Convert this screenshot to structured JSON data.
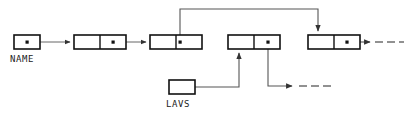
{
  "diagram": {
    "type": "linked-list-pointer-diagram",
    "background_color": "#ffffff",
    "stroke_color": "#1a1a1a",
    "line_color": "#555555",
    "labels": {
      "name": "NAME",
      "lavs": "LAVS"
    },
    "nodes": [
      {
        "id": "name-head",
        "name": "name-head-cell",
        "cells": 1,
        "dots": [
          0
        ],
        "x": 14,
        "y": 35,
        "width": 26,
        "height": 14,
        "label": "NAME"
      },
      {
        "id": "node-1",
        "name": "list-node-1",
        "cells": 2,
        "dots": [
          1
        ],
        "x": 74,
        "y": 35,
        "width": 52,
        "height": 14
      },
      {
        "id": "node-2",
        "name": "list-node-2",
        "cells": 2,
        "dots": [
          1
        ],
        "x": 150,
        "y": 35,
        "width": 52,
        "height": 14
      },
      {
        "id": "node-3",
        "name": "list-node-3",
        "cells": 2,
        "dots": [
          1
        ],
        "x": 228,
        "y": 35,
        "width": 52,
        "height": 14
      },
      {
        "id": "node-4",
        "name": "list-node-4",
        "cells": 2,
        "dots": [
          1
        ],
        "x": 308,
        "y": 35,
        "width": 52,
        "height": 14
      },
      {
        "id": "lavs-head",
        "name": "lavs-head-cell",
        "cells": 1,
        "dots": [],
        "x": 169,
        "y": 80,
        "width": 26,
        "height": 14,
        "label": "LAVS"
      }
    ],
    "connections": [
      {
        "name": "edge-name-to-node1",
        "from": "name-head",
        "to": "node-1",
        "style": "solid",
        "arrow": "right"
      },
      {
        "name": "edge-node1-to-node2",
        "from": "node-1",
        "to": "node-2",
        "style": "solid",
        "arrow": "right"
      },
      {
        "name": "edge-node2-up-over-to-node4",
        "from": "node-2",
        "to": "node-4",
        "style": "solid",
        "arrow": "down",
        "routing": "up-over-down"
      },
      {
        "name": "edge-lavs-up-to-node3",
        "from": "lavs-head",
        "to": "node-3",
        "style": "solid",
        "arrow": "up",
        "routing": "right-up"
      },
      {
        "name": "edge-node3-down-right-dashed",
        "from": "node-3",
        "to": "continuation",
        "style": "solid-then-dashed",
        "arrow": "right",
        "routing": "down-right"
      },
      {
        "name": "edge-node4-right-dashed",
        "from": "node-4",
        "to": "continuation",
        "style": "solid-then-dashed",
        "arrow": "right"
      }
    ],
    "dash_runs": [
      {
        "name": "dash-run-right",
        "x": 372,
        "y": 42,
        "dashes": 3
      },
      {
        "name": "dash-run-bottom",
        "x": 296,
        "y": 86,
        "dashes": 3
      }
    ]
  }
}
